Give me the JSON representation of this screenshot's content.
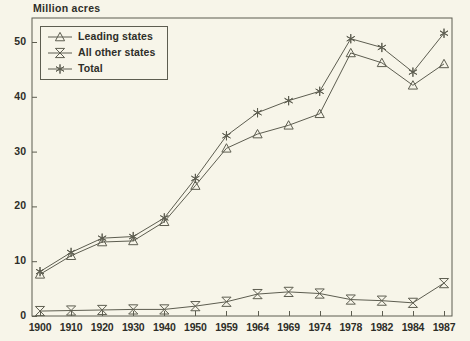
{
  "chart_data": {
    "type": "line",
    "title": "Million acres",
    "xlabel": "",
    "ylabel": "Million acres",
    "grid": false,
    "legend_position": "top-left",
    "categories": [
      "1900",
      "1910",
      "1920",
      "1930",
      "1940",
      "1950",
      "1959",
      "1964",
      "1969",
      "1974",
      "1978",
      "1982",
      "1984",
      "1987"
    ],
    "ylim": [
      0,
      55
    ],
    "yticks": [
      0,
      10,
      20,
      30,
      40,
      50
    ],
    "series": [
      {
        "name": "Leading states",
        "marker": "triangle",
        "values": [
          7.6,
          11.0,
          13.5,
          13.7,
          17.2,
          23.8,
          30.6,
          33.2,
          34.8,
          36.9,
          48.0,
          46.2,
          42.1,
          46.0
        ]
      },
      {
        "name": "All other states",
        "marker": "bowtie",
        "values": [
          0.9,
          1.0,
          1.1,
          1.2,
          1.2,
          1.8,
          2.6,
          4.0,
          4.4,
          4.1,
          3.0,
          2.8,
          2.4,
          6.0
        ]
      },
      {
        "name": "Total",
        "marker": "asterisk",
        "values": [
          8.1,
          11.6,
          14.2,
          14.5,
          17.9,
          25.1,
          32.9,
          37.1,
          39.3,
          41.0,
          50.6,
          49.0,
          44.5,
          51.6
        ]
      }
    ]
  },
  "legend": {
    "items": [
      {
        "label": "Leading states",
        "marker": "triangle"
      },
      {
        "label": "All other states",
        "marker": "bowtie"
      },
      {
        "label": "Total",
        "marker": "asterisk"
      }
    ]
  },
  "axes": {
    "y_labels": [
      "50",
      "40",
      "30",
      "20",
      "10",
      "0"
    ],
    "x_labels": [
      "1900",
      "1910",
      "1920",
      "1930",
      "1940",
      "1950",
      "1959",
      "1964",
      "1969",
      "1974",
      "1978",
      "1982",
      "1984",
      "1987"
    ]
  },
  "colors": {
    "background": "#f7f5e9",
    "ink": "#5d5d50",
    "text": "#2e2e28",
    "series_leading": "#4a4a40",
    "series_other": "#4a4a40",
    "series_total": "#6b6b5c"
  }
}
